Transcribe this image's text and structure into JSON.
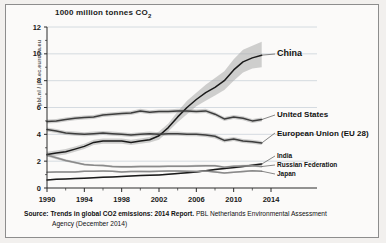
{
  "figure": {
    "title": "1000 million tonnes CO",
    "title_subscript": "2",
    "source_label": "Source:",
    "source_title": "Trends in global CO2 emissions: 2014 Report.",
    "source_rest": "PBL Netherlands Environmental Assessment",
    "source_line2": "Agency (December 2014)",
    "watermark": "pbl.nl / jrc.ec.europa.eu"
  },
  "labels": {
    "china": "China",
    "united_states": "United States",
    "european_union": "European Union (EU 28)",
    "india": "India",
    "russian_federation": "Russian Federation",
    "japan": "Japan"
  },
  "chart_data": {
    "type": "line",
    "title": "1000 million tonnes CO2",
    "xlabel": "",
    "ylabel": "1000 million tonnes CO2",
    "xlim": [
      1990,
      2014
    ],
    "ylim": [
      0,
      12
    ],
    "yticks": [
      0,
      2,
      4,
      6,
      8,
      10,
      12
    ],
    "xticks": [
      1990,
      1994,
      1998,
      2002,
      2006,
      2010,
      2014
    ],
    "grid": "horizontal",
    "legend": "right-inline-labels",
    "uncertainty_band": true,
    "x": [
      1990,
      1991,
      1992,
      1993,
      1994,
      1995,
      1996,
      1997,
      1998,
      1999,
      2000,
      2001,
      2002,
      2003,
      2004,
      2005,
      2006,
      2007,
      2008,
      2009,
      2010,
      2011,
      2012,
      2013
    ],
    "series": [
      {
        "name": "China",
        "color": "#1a1a1a",
        "values": [
          2.5,
          2.6,
          2.7,
          2.9,
          3.1,
          3.4,
          3.5,
          3.5,
          3.5,
          3.4,
          3.5,
          3.6,
          3.9,
          4.5,
          5.3,
          6.0,
          6.6,
          7.1,
          7.5,
          8.0,
          8.8,
          9.4,
          9.7,
          9.9
        ],
        "band_low": [
          2.3,
          2.4,
          2.5,
          2.7,
          2.9,
          3.2,
          3.3,
          3.3,
          3.3,
          3.2,
          3.3,
          3.4,
          3.6,
          4.2,
          4.9,
          5.5,
          6.1,
          6.5,
          6.9,
          7.3,
          8.0,
          8.6,
          8.9,
          9.0
        ],
        "band_high": [
          2.7,
          2.8,
          2.9,
          3.1,
          3.3,
          3.6,
          3.7,
          3.7,
          3.7,
          3.6,
          3.7,
          3.8,
          4.2,
          4.8,
          5.7,
          6.5,
          7.1,
          7.7,
          8.2,
          8.7,
          9.6,
          10.3,
          10.6,
          10.9
        ]
      },
      {
        "name": "United States",
        "color": "#3d3d3d",
        "values": [
          4.95,
          5.0,
          5.1,
          5.2,
          5.25,
          5.3,
          5.45,
          5.5,
          5.55,
          5.6,
          5.75,
          5.65,
          5.7,
          5.7,
          5.75,
          5.75,
          5.7,
          5.75,
          5.5,
          5.15,
          5.3,
          5.2,
          5.0,
          5.1
        ],
        "band_low": [
          4.8,
          4.85,
          4.95,
          5.05,
          5.1,
          5.15,
          5.3,
          5.35,
          5.4,
          5.45,
          5.6,
          5.5,
          5.55,
          5.55,
          5.6,
          5.6,
          5.55,
          5.6,
          5.35,
          5.0,
          5.15,
          5.05,
          4.85,
          4.95
        ],
        "band_high": [
          5.1,
          5.15,
          5.25,
          5.35,
          5.4,
          5.45,
          5.6,
          5.65,
          5.7,
          5.75,
          5.9,
          5.8,
          5.85,
          5.85,
          5.9,
          5.9,
          5.85,
          5.9,
          5.65,
          5.3,
          5.45,
          5.35,
          5.15,
          5.25
        ]
      },
      {
        "name": "European Union (EU 28)",
        "color": "#3d3d3d",
        "values": [
          4.35,
          4.25,
          4.1,
          4.05,
          4.0,
          4.05,
          4.1,
          4.05,
          4.0,
          3.95,
          4.0,
          4.05,
          4.0,
          4.05,
          4.05,
          4.0,
          4.0,
          3.95,
          3.85,
          3.55,
          3.65,
          3.5,
          3.45,
          3.35
        ],
        "band_low": [
          4.2,
          4.1,
          3.95,
          3.9,
          3.85,
          3.9,
          3.95,
          3.9,
          3.85,
          3.8,
          3.85,
          3.9,
          3.85,
          3.9,
          3.9,
          3.85,
          3.85,
          3.8,
          3.7,
          3.4,
          3.5,
          3.35,
          3.3,
          3.2
        ],
        "band_high": [
          4.5,
          4.4,
          4.25,
          4.2,
          4.15,
          4.2,
          4.25,
          4.2,
          4.15,
          4.1,
          4.15,
          4.2,
          4.15,
          4.2,
          4.2,
          4.15,
          4.15,
          4.1,
          4.0,
          3.7,
          3.8,
          3.65,
          3.6,
          3.5
        ]
      },
      {
        "name": "India",
        "color": "#1a1a1a",
        "values": [
          0.6,
          0.65,
          0.68,
          0.7,
          0.73,
          0.77,
          0.8,
          0.83,
          0.86,
          0.9,
          0.93,
          0.95,
          0.98,
          1.02,
          1.08,
          1.13,
          1.2,
          1.28,
          1.37,
          1.45,
          1.52,
          1.6,
          1.7,
          1.78
        ],
        "band_low": [
          0.55,
          0.6,
          0.63,
          0.65,
          0.68,
          0.72,
          0.75,
          0.78,
          0.81,
          0.85,
          0.88,
          0.9,
          0.93,
          0.97,
          1.03,
          1.08,
          1.14,
          1.22,
          1.3,
          1.38,
          1.44,
          1.52,
          1.62,
          1.69
        ],
        "band_high": [
          0.65,
          0.7,
          0.73,
          0.75,
          0.78,
          0.82,
          0.85,
          0.88,
          0.91,
          0.95,
          0.98,
          1.0,
          1.03,
          1.07,
          1.13,
          1.18,
          1.26,
          1.34,
          1.44,
          1.52,
          1.6,
          1.68,
          1.78,
          1.87
        ]
      },
      {
        "name": "Russian Federation",
        "color": "#8a8a8a",
        "values": [
          2.45,
          2.25,
          2.05,
          1.9,
          1.75,
          1.7,
          1.68,
          1.6,
          1.58,
          1.58,
          1.6,
          1.6,
          1.6,
          1.62,
          1.62,
          1.62,
          1.65,
          1.66,
          1.66,
          1.55,
          1.62,
          1.65,
          1.66,
          1.6
        ],
        "band_low": [
          2.35,
          2.15,
          1.95,
          1.82,
          1.68,
          1.63,
          1.6,
          1.53,
          1.5,
          1.5,
          1.52,
          1.52,
          1.52,
          1.54,
          1.54,
          1.54,
          1.57,
          1.58,
          1.58,
          1.48,
          1.54,
          1.57,
          1.58,
          1.52
        ],
        "band_high": [
          2.55,
          2.35,
          2.15,
          1.98,
          1.82,
          1.77,
          1.76,
          1.67,
          1.66,
          1.66,
          1.68,
          1.68,
          1.68,
          1.7,
          1.7,
          1.7,
          1.73,
          1.74,
          1.74,
          1.62,
          1.7,
          1.73,
          1.74,
          1.68
        ]
      },
      {
        "name": "Japan",
        "color": "#8a8a8a",
        "values": [
          1.18,
          1.2,
          1.2,
          1.2,
          1.25,
          1.25,
          1.26,
          1.25,
          1.2,
          1.23,
          1.24,
          1.22,
          1.25,
          1.26,
          1.26,
          1.25,
          1.24,
          1.27,
          1.2,
          1.12,
          1.17,
          1.22,
          1.28,
          1.25
        ],
        "band_low": [
          1.12,
          1.14,
          1.14,
          1.14,
          1.19,
          1.19,
          1.2,
          1.19,
          1.14,
          1.17,
          1.18,
          1.16,
          1.19,
          1.2,
          1.2,
          1.19,
          1.18,
          1.21,
          1.14,
          1.06,
          1.11,
          1.16,
          1.22,
          1.19
        ],
        "band_high": [
          1.24,
          1.26,
          1.26,
          1.26,
          1.31,
          1.31,
          1.32,
          1.31,
          1.26,
          1.29,
          1.3,
          1.28,
          1.31,
          1.32,
          1.32,
          1.31,
          1.3,
          1.33,
          1.26,
          1.18,
          1.23,
          1.28,
          1.34,
          1.31
        ]
      }
    ]
  }
}
